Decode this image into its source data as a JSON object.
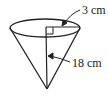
{
  "diagram": {
    "type": "cone",
    "labels": {
      "radius": "3 cm",
      "height": "18 cm"
    },
    "colors": {
      "stroke": "#222222",
      "background": "#ffffff"
    }
  }
}
